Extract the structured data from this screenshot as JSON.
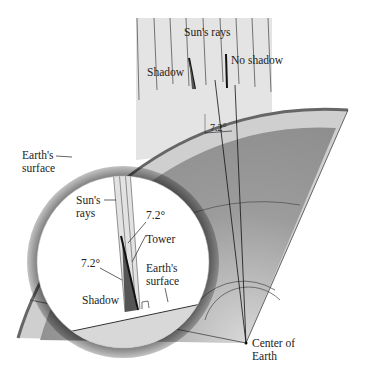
{
  "labels": {
    "suns_rays_top": "Sun's rays",
    "shadow_top": "Shadow",
    "no_shadow": "No shadow",
    "angle_top": "7.2°",
    "earths_surface_left_1": "Earth's",
    "earths_surface_left_2": "surface",
    "inset_suns_rays_1": "Sun's",
    "inset_suns_rays_2": "rays",
    "inset_angle_upper": "7.2°",
    "inset_tower": "Tower",
    "inset_angle_lower": "7.2°",
    "inset_earths_surface_1": "Earth's",
    "inset_earths_surface_2": "surface",
    "inset_shadow": "Shadow",
    "center_1": "Center of",
    "center_2": "Earth"
  },
  "colors": {
    "crust": "#7a7a7a",
    "outer_band": "#cfcfcf",
    "interior": "#9a9a9a",
    "rays_bg": "#e2e2e2",
    "ground": "#d6d6d6"
  }
}
